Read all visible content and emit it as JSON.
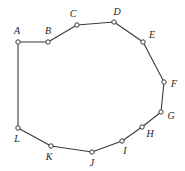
{
  "figure": {
    "title": "",
    "background_color": "#ffffff",
    "width": 185,
    "height": 171,
    "edge_color": "#3a3a3c",
    "edge_width": 1.1,
    "marker_fill": "#ffffff",
    "marker_stroke": "#3a3a3c",
    "marker_radius": 2.2,
    "label_color": "#231f20",
    "shape": "closed-polygon",
    "vertex_count": 12
  },
  "polygon": {
    "closed": true,
    "vertices": [
      {
        "label": "A",
        "x": 18,
        "y": 42,
        "label_x": 17,
        "label_y": 31
      },
      {
        "label": "B",
        "x": 48,
        "y": 42,
        "label_x": 48,
        "label_y": 31
      },
      {
        "label": "C",
        "x": 77,
        "y": 25,
        "label_x": 73,
        "label_y": 14
      },
      {
        "label": "D",
        "x": 114,
        "y": 22,
        "label_x": 117,
        "label_y": 12
      },
      {
        "label": "E",
        "x": 143,
        "y": 42,
        "label_x": 152,
        "label_y": 35
      },
      {
        "label": "F",
        "x": 164,
        "y": 82,
        "label_x": 174,
        "label_y": 84
      },
      {
        "label": "G",
        "x": 161,
        "y": 112,
        "label_x": 171,
        "label_y": 116
      },
      {
        "label": "H",
        "x": 142,
        "y": 127,
        "label_x": 150,
        "label_y": 134
      },
      {
        "label": "I",
        "x": 122,
        "y": 141,
        "label_x": 125,
        "label_y": 151
      },
      {
        "label": "J",
        "x": 92,
        "y": 152,
        "label_x": 92,
        "label_y": 163
      },
      {
        "label": "K",
        "x": 51,
        "y": 146,
        "label_x": 49,
        "label_y": 157
      },
      {
        "label": "L",
        "x": 18,
        "y": 128,
        "label_x": 17,
        "label_y": 139
      }
    ]
  }
}
